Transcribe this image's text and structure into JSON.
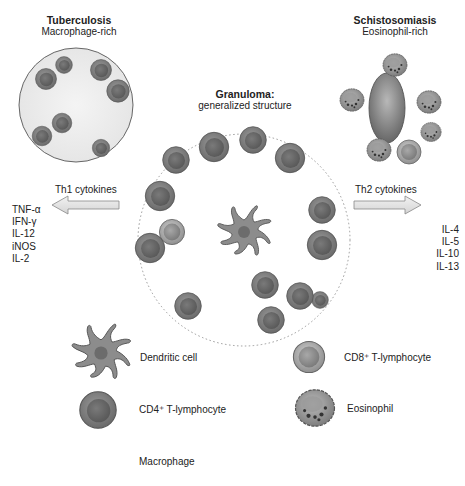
{
  "tuberculosis": {
    "title": "Tuberculosis",
    "subtitle": "Macrophage-rich"
  },
  "schistosomiasis": {
    "title": "Schistosomiasis",
    "subtitle": "Eosinophil-rich"
  },
  "granuloma": {
    "title": "Granuloma:",
    "subtitle": "generalized structure"
  },
  "th1": {
    "label": "Th1 cytokines",
    "cytokines": [
      "TNF-α",
      "IFN-γ",
      "IL-12",
      "iNOS",
      "IL-2"
    ]
  },
  "th2": {
    "label": "Th2 cytokines",
    "cytokines": [
      "IL-4",
      "IL-5",
      "IL-10",
      "IL-13"
    ]
  },
  "legend": {
    "dendritic": "Dendritic cell",
    "cd4": "CD4⁺ T-lymphocyte",
    "macrophage": "Macrophage",
    "cd8": "CD8⁺ T-lymphocyte",
    "eosinophil": "Eosinophil"
  },
  "colors": {
    "lymph_outer": "#8a8a8a",
    "lymph_inner": "#6e6e6e",
    "macrophage_fill": "#e6e6e6",
    "outline": "#555555"
  }
}
